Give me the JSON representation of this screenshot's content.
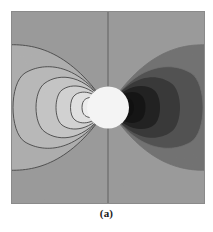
{
  "figure": {
    "caption": "(a)",
    "panel_label": "(a)"
  },
  "chart_data": {
    "type": "heatmap",
    "title": "",
    "subtitle": "",
    "xlabel": "",
    "ylabel": "",
    "grid": false,
    "legend": "none",
    "xlim": [
      -1,
      1
    ],
    "ylim": [
      -1,
      1
    ],
    "axis_line_x": 0,
    "contour_levels": [
      -8,
      -4,
      -2,
      -1,
      -0.5,
      -0.25,
      0.25,
      0.5,
      1,
      2,
      4,
      8
    ],
    "fill_colors": [
      "#ffffff",
      "#f0f0f0",
      "#e2e2e2",
      "#d4d4d4",
      "#c6c6c6",
      "#b9b9b9",
      "#9a9a9a",
      "#6e6e6e",
      "#4a4a4a",
      "#3a3a3a",
      "#1c1c1c",
      "#050505"
    ],
    "background_color": "#9a9a9a",
    "contour_line_color": "#3d3d3d",
    "source_marker": {
      "shape": "circle",
      "color": "#ffffff",
      "center": [
        0,
        0
      ],
      "radius_px": 21
    },
    "positive_lobe_side": "left",
    "negative_lobe_side": "right",
    "series": [
      {
        "name": "positive-lobes-left",
        "values": [
          0.25,
          0.5,
          1,
          2,
          4,
          8
        ]
      },
      {
        "name": "negative-lobes-right",
        "values": [
          -0.25,
          -0.5,
          -1,
          -2,
          -4,
          -8
        ]
      }
    ]
  },
  "colors": {
    "page_background": "#ffffff",
    "plot_background": "#9a9a9a",
    "axis_line": "#555555",
    "caption_text": "#1a1a1a",
    "frame_border": "#8a8a8a"
  }
}
